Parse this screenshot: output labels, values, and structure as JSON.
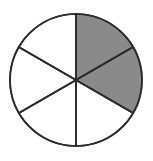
{
  "figure": {
    "shape": "circle",
    "total_sectors": 6,
    "shaded_sectors": 2,
    "unshaded_sectors": 4,
    "fraction_label": "2/6",
    "simplified_fraction": "1/3",
    "percent_shaded": "33.3%"
  },
  "colors": {
    "shaded_fill": "#8a8a8a",
    "unshaded_fill": "#ffffff",
    "outline": "#2b2b2b",
    "background": "#ffffff"
  },
  "geometry": {
    "center_x": 76,
    "center_y": 80,
    "radius": 66,
    "sector_angle_degrees": 60,
    "start_angle_degrees": 0
  },
  "chart_data": {
    "type": "pie",
    "title": "",
    "categories": [
      "Sector 1",
      "Sector 2",
      "Sector 3",
      "Sector 4",
      "Sector 5",
      "Sector 6"
    ],
    "values": [
      1,
      1,
      1,
      1,
      1,
      1
    ],
    "labels": [],
    "legend": [],
    "slices": [
      {
        "index": 1,
        "start_deg": 0,
        "end_deg": 60,
        "shaded": true,
        "fill": "#8a8a8a"
      },
      {
        "index": 2,
        "start_deg": 60,
        "end_deg": 120,
        "shaded": true,
        "fill": "#8a8a8a"
      },
      {
        "index": 3,
        "start_deg": 120,
        "end_deg": 180,
        "shaded": false,
        "fill": "#ffffff"
      },
      {
        "index": 4,
        "start_deg": 180,
        "end_deg": 240,
        "shaded": false,
        "fill": "#ffffff"
      },
      {
        "index": 5,
        "start_deg": 240,
        "end_deg": 300,
        "shaded": false,
        "fill": "#ffffff"
      },
      {
        "index": 6,
        "start_deg": 300,
        "end_deg": 360,
        "shaded": false,
        "fill": "#ffffff"
      }
    ]
  }
}
